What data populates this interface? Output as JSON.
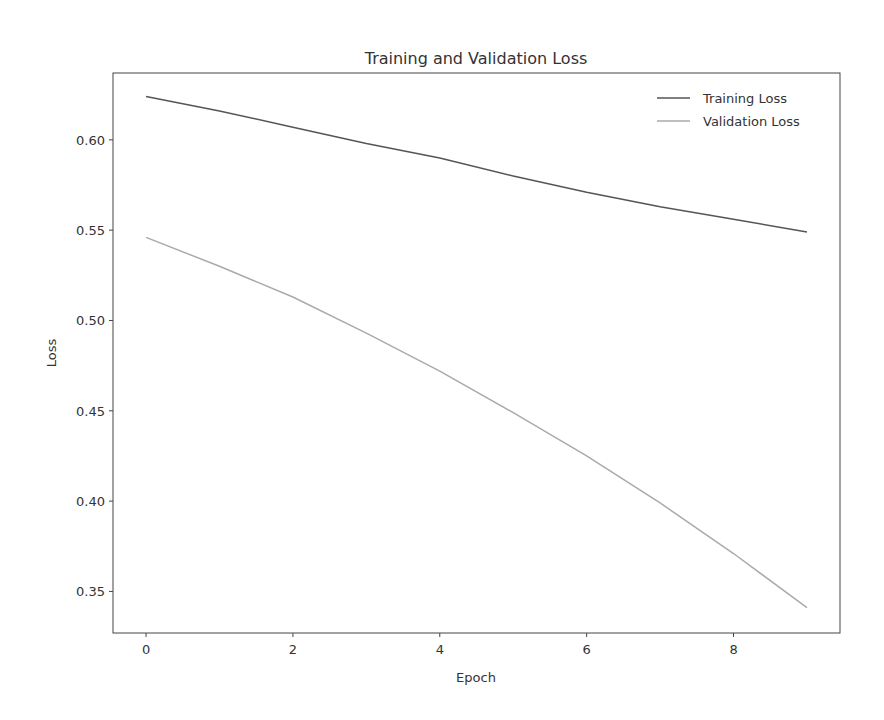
{
  "chart_data": {
    "type": "line",
    "title": "Training and Validation Loss",
    "xlabel": "Epoch",
    "ylabel": "Loss",
    "x": [
      0,
      1,
      2,
      3,
      4,
      5,
      6,
      7,
      8,
      9
    ],
    "series": [
      {
        "name": "Training Loss",
        "color": "#555555",
        "values": [
          0.624,
          0.616,
          0.607,
          0.598,
          0.59,
          0.58,
          0.571,
          0.563,
          0.556,
          0.549
        ]
      },
      {
        "name": "Validation Loss",
        "color": "#aaaaaa",
        "values": [
          0.546,
          0.53,
          0.513,
          0.493,
          0.472,
          0.449,
          0.425,
          0.399,
          0.371,
          0.341
        ]
      }
    ],
    "xticks": [
      0,
      2,
      4,
      6,
      8
    ],
    "yticks": [
      0.35,
      0.4,
      0.45,
      0.5,
      0.55,
      0.6
    ],
    "ytick_labels": [
      "0.35",
      "0.40",
      "0.45",
      "0.50",
      "0.55",
      "0.60"
    ],
    "xlim": [
      -0.45,
      9.45
    ],
    "ylim": [
      0.327,
      0.637
    ],
    "grid": false,
    "legend_position": "upper right"
  }
}
